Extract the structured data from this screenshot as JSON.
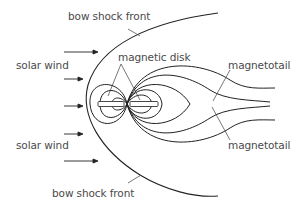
{
  "diagram": {
    "labels": {
      "bow_shock_top": "bow shock front",
      "bow_shock_bottom": "bow shock front",
      "solar_wind_top": "solar wind",
      "solar_wind_bottom": "solar wind",
      "magnetic_disk": "magnetic disk",
      "magnetotail_top": "magnetotail",
      "magnetotail_bottom": "magnetotail"
    },
    "arrows": {
      "count": 5,
      "direction": "right"
    },
    "colors": {
      "line": "#222222",
      "leader": "#555555",
      "text": "#4a4a4a",
      "background": "#ffffff"
    }
  }
}
